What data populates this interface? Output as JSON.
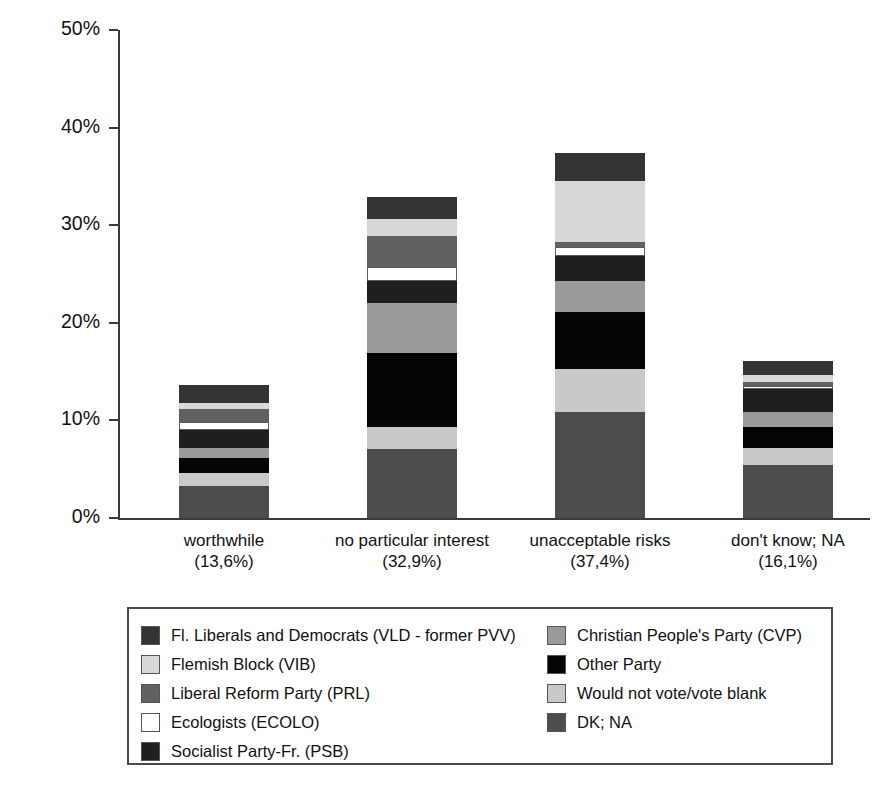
{
  "chart_data": {
    "type": "bar",
    "subtype": "stacked-bar",
    "title": "",
    "xlabel": "",
    "ylabel": "",
    "ylim": [
      0,
      50
    ],
    "ytick_values": [
      0,
      10,
      20,
      30,
      40,
      50
    ],
    "ytick_labels": [
      "0%",
      "10%",
      "20%",
      "30%",
      "40%",
      "50%"
    ],
    "grid": false,
    "legend_position": "below-plot",
    "categories": [
      "worthwhile",
      "no particular interest",
      "unacceptable risks",
      "don't know; NA"
    ],
    "category_sublabels": [
      "(13,6%)",
      "(32,9%)",
      "(37,4%)",
      "(16,1%)"
    ],
    "category_totals": [
      13.6,
      32.9,
      37.4,
      16.1
    ],
    "stack_order_bottom_to_top": [
      "DK; NA",
      "Would not vote/vote blank",
      "Other Party",
      "Christian People's Party (CVP)",
      "Socialist Party-Fr. (PSB)",
      "Ecologists (ECOLO)",
      "Liberal Reform Party (PRL)",
      "Flemish Block (VIB)",
      "Fl. Liberals and Democrats (VLD - former PVV)"
    ],
    "series": [
      {
        "name": "DK; NA",
        "color": "#4d4d4d",
        "values": [
          3.3,
          7.1,
          10.9,
          5.4
        ]
      },
      {
        "name": "Would not vote/vote blank",
        "color": "#c9c9c9",
        "values": [
          1.3,
          2.2,
          4.4,
          1.8
        ]
      },
      {
        "name": "Other Party",
        "color": "#050505",
        "values": [
          1.5,
          7.6,
          5.8,
          2.1
        ]
      },
      {
        "name": "Christian People's Party (CVP)",
        "color": "#9a9a9a",
        "values": [
          1.1,
          5.1,
          3.2,
          1.6
        ]
      },
      {
        "name": "Socialist Party-Fr. (PSB)",
        "color": "#1f1f1f",
        "values": [
          1.8,
          2.3,
          2.6,
          2.3
        ]
      },
      {
        "name": "Ecologists (ECOLO)",
        "color": "#ffffff",
        "values": [
          0.8,
          1.4,
          0.9,
          0.3
        ]
      },
      {
        "name": "Liberal Reform Party (PRL)",
        "color": "#616161",
        "values": [
          1.4,
          3.2,
          0.5,
          0.4
        ]
      },
      {
        "name": "Flemish Block (VIB)",
        "color": "#d8d8d8",
        "values": [
          0.6,
          1.7,
          6.2,
          0.8
        ]
      },
      {
        "name": "Fl. Liberals and Democrats (VLD - former PVV)",
        "color": "#333333",
        "values": [
          1.8,
          2.3,
          2.9,
          1.4
        ]
      }
    ]
  },
  "axis": {
    "y_labels": [
      "50%",
      "40%",
      "30%",
      "20%",
      "10%",
      "0%"
    ]
  },
  "x_axis": {
    "items": [
      {
        "label": "worthwhile",
        "sublabel": "(13,6%)"
      },
      {
        "label": "no particular interest",
        "sublabel": "(32,9%)"
      },
      {
        "label": "unacceptable risks",
        "sublabel": "(37,4%)"
      },
      {
        "label": "don't know; NA",
        "sublabel": "(16,1%)"
      }
    ]
  },
  "legend": {
    "left_column": [
      {
        "label": "Fl. Liberals and Democrats (VLD - former PVV)",
        "color": "#333333"
      },
      {
        "label": "Flemish Block (VIB)",
        "color": "#d8d8d8"
      },
      {
        "label": "Liberal Reform Party (PRL)",
        "color": "#616161"
      },
      {
        "label": "Ecologists (ECOLO)",
        "color": "#ffffff"
      },
      {
        "label": "Socialist Party-Fr. (PSB)",
        "color": "#1f1f1f"
      }
    ],
    "right_column": [
      {
        "label": "Christian People's Party (CVP)",
        "color": "#9a9a9a"
      },
      {
        "label": "Other Party",
        "color": "#050505"
      },
      {
        "label": "Would not vote/vote blank",
        "color": "#c9c9c9"
      },
      {
        "label": "DK; NA",
        "color": "#4d4d4d"
      }
    ]
  }
}
